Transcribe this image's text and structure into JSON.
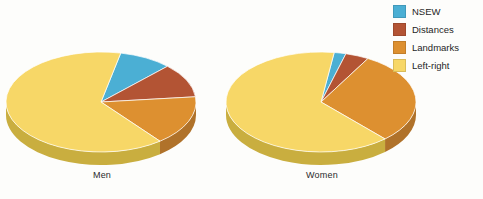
{
  "figure": {
    "background_color": "#fdfdfb",
    "text_color": "#2b2b2b"
  },
  "legend": {
    "position": "top-right",
    "items": [
      {
        "label": "NSEW",
        "color": "#4BAFD4",
        "key": "nsew"
      },
      {
        "label": "Distances",
        "color": "#B35434",
        "key": "distances"
      },
      {
        "label": "Landmarks",
        "color": "#DD9030",
        "key": "landmarks"
      },
      {
        "label": "Left-right",
        "color": "#F7D767",
        "key": "left-right"
      }
    ]
  },
  "charts": [
    {
      "caption": "Men"
    },
    {
      "caption": "Women"
    }
  ],
  "chart_data": {
    "type": "pie",
    "title": "",
    "xlabel": "",
    "ylabel": "",
    "legend_position": "top-right",
    "grid": false,
    "three_d": true,
    "categories": [
      "NSEW",
      "Distances",
      "Landmarks",
      "Left-right"
    ],
    "colors": [
      "#4BAFD4",
      "#B35434",
      "#DD9030",
      "#F7D767"
    ],
    "side_colors": [
      "#3A8CA8",
      "#8C4029",
      "#B0722A",
      "#C9AE3F"
    ],
    "charts": [
      {
        "title": "Men",
        "values": [
          9,
          11,
          16,
          64
        ],
        "unit": "percent"
      },
      {
        "title": "Women",
        "values": [
          2,
          4,
          30,
          64
        ],
        "unit": "percent"
      }
    ]
  }
}
